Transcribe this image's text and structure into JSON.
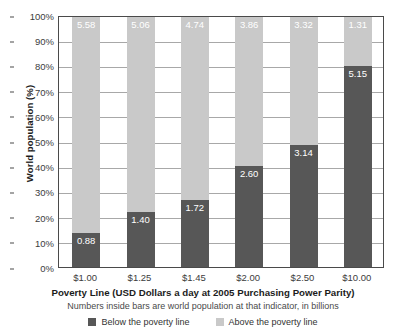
{
  "chart_data": {
    "type": "bar",
    "subtype": "stacked-bar-100-percent",
    "title": "",
    "xlabel": "Poverty Line (USD Dollars a day at 2005 Purchasing Power Parity)",
    "xsublabel": "Numbers inside bars are world population at that indicator, in billions",
    "ylabel": "World population (%)",
    "ylim": [
      0,
      100
    ],
    "grid": true,
    "legend_position": "bottom",
    "categories": [
      "$1.00",
      "$1.25",
      "$1.45",
      "$2.00",
      "$2.50",
      "$10.00"
    ],
    "y_ticks": [
      "0%",
      "10%",
      "20%",
      "30%",
      "40%",
      "50%",
      "60%",
      "70%",
      "80%",
      "90%",
      "100%"
    ],
    "y_tick_values": [
      0,
      10,
      20,
      30,
      40,
      50,
      60,
      70,
      80,
      90,
      100
    ],
    "series": [
      {
        "name": "Below the poverty line",
        "color": "#575757",
        "values_billions": [
          0.88,
          1.4,
          1.72,
          2.6,
          3.14,
          5.15
        ],
        "values_percent": [
          13.6,
          21.7,
          26.6,
          40.2,
          48.6,
          79.7
        ],
        "labels": [
          "0.88",
          "1.40",
          "1.72",
          "2.60",
          "3.14",
          "5.15"
        ]
      },
      {
        "name": "Above the poverty line",
        "color": "#c9c9c9",
        "values_billions": [
          5.58,
          5.06,
          4.74,
          3.86,
          3.32,
          1.31
        ],
        "values_percent": [
          86.4,
          78.3,
          73.4,
          59.8,
          51.4,
          20.3
        ],
        "labels": [
          "5.58",
          "5.06",
          "4.74",
          "3.86",
          "3.32",
          "1.31"
        ]
      }
    ],
    "units": "billions of people",
    "total_billions": 6.46
  },
  "legend": {
    "items": [
      {
        "label": "Below the poverty line",
        "color": "#575757"
      },
      {
        "label": "Above the poverty line",
        "color": "#c9c9c9"
      }
    ]
  },
  "colors": {
    "below": "#575757",
    "above": "#c9c9c9",
    "grid": "#a8a8a8",
    "axis": "#4a4a4a",
    "text": "#3c3c3c",
    "label_text": "#ffffff"
  }
}
